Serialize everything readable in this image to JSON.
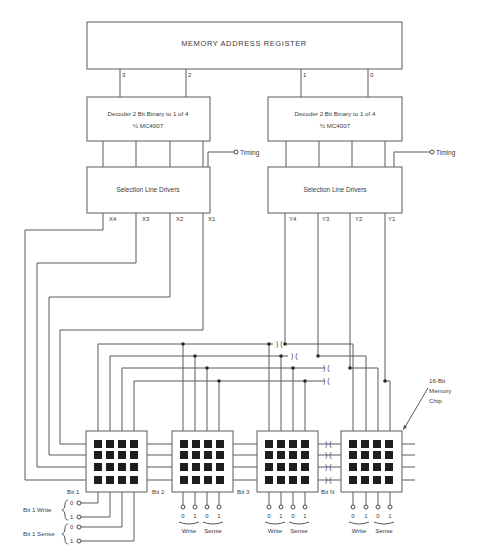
{
  "diagram": {
    "register": {
      "label": "MEMORY ADDRESS REGISTER",
      "outputs": [
        "3",
        "2",
        "1",
        "0"
      ]
    },
    "decoders": [
      {
        "line1": "Decoder 2 Bit Binary to 1 of 4",
        "line2": "½ MC4007"
      },
      {
        "line1": "Decoder 2 Bit Binary to 1 of 4",
        "line2": "½ MC4007"
      }
    ],
    "timing_label": "Timing",
    "drivers": [
      {
        "label": "Selection Line Drivers",
        "outputs": [
          "X4",
          "X3",
          "X2",
          "X1"
        ]
      },
      {
        "label": "Selection Line Drivers",
        "outputs": [
          "Y4",
          "Y3",
          "Y2",
          "Y1"
        ]
      }
    ],
    "chips": [
      {
        "label": "Bit 1"
      },
      {
        "label": "Bit 2"
      },
      {
        "label": "Bit 3"
      },
      {
        "label": "Bit N"
      }
    ],
    "chip_callout": [
      "16-Bit",
      "Memory",
      "Chip"
    ],
    "bit1_lines": {
      "write_label": "Bit 1 Write",
      "sense_label": "Bit 1 Sense",
      "write_terms": [
        "0",
        "1"
      ],
      "sense_terms": [
        "0",
        "1"
      ]
    },
    "chip_terminals": {
      "values": [
        "0",
        "1",
        "0",
        "1"
      ],
      "write_label": "Write",
      "sense_label": "Sense"
    }
  }
}
